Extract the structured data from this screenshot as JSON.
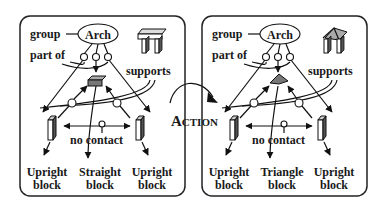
{
  "panels": [
    {
      "id": "before",
      "group_label": "group",
      "concept": "Arch",
      "part_of_label": "part of",
      "supports_label": "supports",
      "no_contact_label": "no contact",
      "icon": "table-arch-icon",
      "top_block_shape": "straight",
      "blocks": [
        {
          "line1": "Upright",
          "line2": "block"
        },
        {
          "line1": "Straight",
          "line2": "block"
        },
        {
          "line1": "Upright",
          "line2": "block"
        }
      ]
    },
    {
      "id": "after",
      "group_label": "group",
      "concept": "Arch",
      "part_of_label": "part of",
      "supports_label": "supports",
      "no_contact_label": "no contact",
      "icon": "triangle-arch-icon",
      "top_block_shape": "triangle",
      "blocks": [
        {
          "line1": "Upright",
          "line2": "block"
        },
        {
          "line1": "Triangle",
          "line2": "block"
        },
        {
          "line1": "Upright",
          "line2": "block"
        }
      ]
    }
  ],
  "action": {
    "label_big": "A",
    "label_small": "CTION"
  },
  "colors": {
    "ink": "#111111",
    "block_fill": "#777777",
    "background": "#ffffff"
  }
}
